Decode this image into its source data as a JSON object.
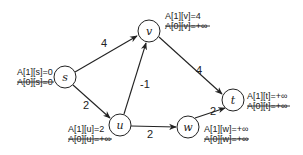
{
  "diagram": {
    "type": "directed-weighted-graph",
    "nodes": [
      {
        "id": "s",
        "label": "s",
        "annotations": [
          {
            "text": "A[1][s]=0",
            "struck": false
          },
          {
            "text": "A[0][s]=0",
            "struck": true
          }
        ]
      },
      {
        "id": "v",
        "label": "v",
        "annotations": [
          {
            "text": "A[1][v]=4",
            "struck": false
          },
          {
            "text": "A[0][v]=+∞",
            "struck": true
          }
        ]
      },
      {
        "id": "t",
        "label": "t",
        "annotations": [
          {
            "text": "A[1][t]=+∞",
            "struck": false
          },
          {
            "text": "A[0][t]=+∞",
            "struck": true
          }
        ]
      },
      {
        "id": "u",
        "label": "u",
        "annotations": [
          {
            "text": "A[1][u]=2",
            "struck": false
          },
          {
            "text": "A[0][u]=+∞",
            "struck": true
          }
        ]
      },
      {
        "id": "w",
        "label": "w",
        "annotations": [
          {
            "text": "A[1][w]=+∞",
            "struck": false
          },
          {
            "text": "A[0][w]=+∞",
            "struck": true
          }
        ]
      }
    ],
    "edges": [
      {
        "from": "s",
        "to": "v",
        "weight": "4"
      },
      {
        "from": "v",
        "to": "t",
        "weight": "4"
      },
      {
        "from": "u",
        "to": "v",
        "weight": "-1"
      },
      {
        "from": "s",
        "to": "u",
        "weight": "2"
      },
      {
        "from": "u",
        "to": "w",
        "weight": "2"
      },
      {
        "from": "w",
        "to": "t",
        "weight": "2"
      }
    ]
  }
}
